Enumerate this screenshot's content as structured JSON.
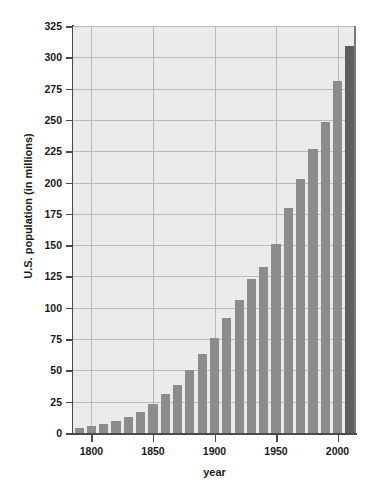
{
  "chart_data": {
    "type": "bar",
    "title": "",
    "xlabel": "year",
    "ylabel": "U.S. population (in millions)",
    "xlim": [
      1785,
      2015
    ],
    "ylim": [
      0,
      325
    ],
    "grid": true,
    "legend": null,
    "y_ticks": [
      0,
      25,
      50,
      75,
      100,
      125,
      150,
      175,
      200,
      225,
      250,
      275,
      300,
      325
    ],
    "x_ticks": [
      1800,
      1850,
      1900,
      1950,
      2000
    ],
    "bar_color": "#8c8c8c",
    "highlight_color": "#5e5e5e",
    "plot_background": "#ebebeb",
    "gridline_color": "#b9b9b9",
    "axis_color": "#4a4a4a",
    "highlighted_index": 22,
    "categories": [
      1790,
      1800,
      1810,
      1820,
      1830,
      1840,
      1850,
      1860,
      1870,
      1880,
      1890,
      1900,
      1910,
      1920,
      1930,
      1940,
      1950,
      1960,
      1970,
      1980,
      1990,
      2000,
      2010
    ],
    "values": [
      3.9,
      5.3,
      7.2,
      9.6,
      12.9,
      17.1,
      23.2,
      31.4,
      38.6,
      50.2,
      63.0,
      76.2,
      92.2,
      106.0,
      123.2,
      132.2,
      151.3,
      179.3,
      203.2,
      226.5,
      248.7,
      281.4,
      308.7
    ]
  },
  "axis_titles": {
    "y": "U.S. population (in millions)",
    "x": "year"
  }
}
